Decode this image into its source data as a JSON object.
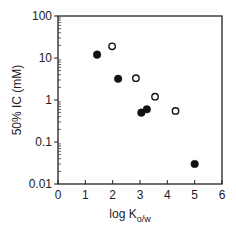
{
  "chart_data": {
    "type": "scatter",
    "title": "",
    "xlabel": "log K",
    "xlabel_subscript": "o/w",
    "ylabel": "50% IC (mM)",
    "xlim": [
      0,
      6
    ],
    "ylim": [
      0.01,
      100
    ],
    "yscale": "log",
    "grid": false,
    "legend": null,
    "x_ticks": [
      "0",
      "1",
      "2",
      "3",
      "4",
      "5",
      "6"
    ],
    "y_ticks": [
      "100",
      "10",
      "1",
      "0.1",
      "0.01"
    ],
    "series": [
      {
        "name": "filled",
        "marker": "filled-circle",
        "color": "#111111",
        "points": [
          {
            "x": 1.43,
            "y": 12
          },
          {
            "x": 2.2,
            "y": 3.2
          },
          {
            "x": 3.05,
            "y": 0.5
          },
          {
            "x": 3.25,
            "y": 0.6
          },
          {
            "x": 5.0,
            "y": 0.03
          }
        ]
      },
      {
        "name": "open",
        "marker": "open-circle",
        "color": "#111111",
        "points": [
          {
            "x": 1.98,
            "y": 19
          },
          {
            "x": 2.85,
            "y": 3.3
          },
          {
            "x": 3.55,
            "y": 1.2
          },
          {
            "x": 4.3,
            "y": 0.55
          }
        ]
      }
    ]
  }
}
